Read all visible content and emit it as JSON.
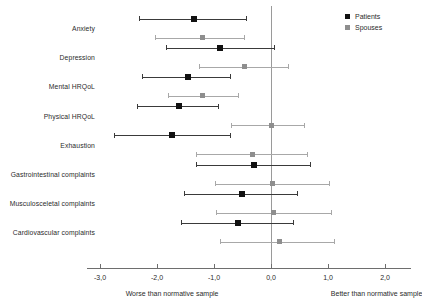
{
  "chart_data": {
    "type": "scatter",
    "subtype": "forest-plot",
    "title": "",
    "xlabel": "",
    "ylabel": "",
    "xlim": [
      -3.2,
      2.45
    ],
    "xticks": [
      -3.0,
      -2.0,
      -1.0,
      0.0,
      1.0,
      2.0
    ],
    "xtick_labels": [
      "-3,0",
      "-2,0",
      "-1,0",
      "0,0",
      "1,0",
      "2,0"
    ],
    "grid": false,
    "reference_line": 0.0,
    "legend_position": "top-right",
    "categories": [
      "Anxiety",
      "Depression",
      "Mental HRQoL",
      "Physical HRQoL",
      "Exhaustion",
      "Gastrointestinal complaints",
      "Musculosceletal complaints",
      "Cardiovascular complaints"
    ],
    "series": [
      {
        "name": "Patients",
        "color": "#111111",
        "values": [
          -1.35,
          -0.89,
          -1.46,
          -1.62,
          -1.74,
          -0.3,
          -0.51,
          -0.58
        ],
        "ci_lower": [
          -2.32,
          -1.84,
          -2.26,
          -2.35,
          -2.75,
          -1.32,
          -1.53,
          -1.58
        ],
        "ci_upper": [
          -0.44,
          0.06,
          -0.72,
          -0.93,
          -0.72,
          0.68,
          0.46,
          0.39
        ]
      },
      {
        "name": "Spouses",
        "color": "#8e8e8e",
        "values": [
          -1.21,
          -0.47,
          -1.21,
          0.0,
          -0.33,
          0.02,
          0.04,
          0.15
        ],
        "ci_lower": [
          -2.03,
          -1.27,
          -1.8,
          -0.7,
          -1.31,
          -0.98,
          -0.97,
          -0.89
        ],
        "ci_upper": [
          -0.47,
          0.29,
          -0.58,
          0.58,
          0.64,
          1.02,
          1.05,
          1.11
        ]
      }
    ],
    "annotations": [
      {
        "text": "Worse than normative sample",
        "x": -2.55,
        "position": "below-axis-left"
      },
      {
        "text": "Better than normative sample",
        "x": 1.05,
        "position": "below-axis-right"
      }
    ]
  },
  "legend": {
    "items": [
      {
        "label": "Patients",
        "swatch": "square-dark"
      },
      {
        "label": "Spouses",
        "swatch": "square-gray"
      }
    ]
  }
}
